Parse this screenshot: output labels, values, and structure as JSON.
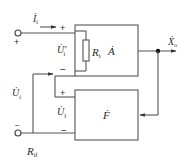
{
  "diagram": {
    "type": "feedback-amplifier-block-diagram",
    "colors": {
      "stroke": "#555555",
      "text": "#2a2a2a",
      "background": "#ffffff"
    },
    "blocks": [
      {
        "id": "A",
        "label_r": "R",
        "label_r_sub": "i",
        "label_gain": "Ȧ",
        "description": "basic amplifier with input resistance"
      },
      {
        "id": "F",
        "label": "Ḟ",
        "description": "feedback network"
      }
    ],
    "labels": {
      "input_current": {
        "main": "İ",
        "sub": "i"
      },
      "net_input_voltage": {
        "main": "U̇′",
        "sub": "i"
      },
      "input_voltage": {
        "main": "U̇",
        "sub": "i"
      },
      "feedback_voltage": {
        "main": "U̇",
        "sub": "f"
      },
      "output": {
        "main": "Ẋ",
        "sub": "o"
      },
      "input_resistance": {
        "main": "R",
        "sub": "if"
      }
    },
    "signs": {
      "a_plus": "+",
      "a_minus": "−",
      "f_plus": "+",
      "f_minus": "−",
      "terminal_plus": "+",
      "terminal_minus": "−"
    }
  }
}
